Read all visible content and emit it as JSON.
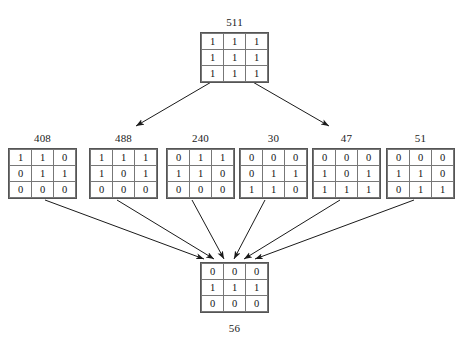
{
  "diagram": {
    "title_text": "",
    "type": "tree-of-binary-3x3-grids",
    "stroke_color": "#1a1a1a",
    "grid_border_color": "#777777",
    "background_color": "#ffffff"
  },
  "root": {
    "label": "511",
    "cells": [
      [
        "1",
        "1",
        "1"
      ],
      [
        "1",
        "1",
        "1"
      ],
      [
        "1",
        "1",
        "1"
      ]
    ],
    "x": 200,
    "y": 32
  },
  "middle": [
    {
      "label": "408",
      "cells": [
        [
          "1",
          "1",
          "0"
        ],
        [
          "0",
          "1",
          "1"
        ],
        [
          "0",
          "0",
          "0"
        ]
      ],
      "x": 8,
      "y": 148
    },
    {
      "label": "488",
      "cells": [
        [
          "1",
          "1",
          "1"
        ],
        [
          "1",
          "0",
          "1"
        ],
        [
          "0",
          "0",
          "0"
        ]
      ],
      "x": 89,
      "y": 148
    },
    {
      "label": "240",
      "cells": [
        [
          "0",
          "1",
          "1"
        ],
        [
          "1",
          "1",
          "0"
        ],
        [
          "0",
          "0",
          "0"
        ]
      ],
      "x": 166,
      "y": 148
    },
    {
      "label": "30",
      "cells": [
        [
          "0",
          "0",
          "0"
        ],
        [
          "0",
          "1",
          "1"
        ],
        [
          "1",
          "1",
          "0"
        ]
      ],
      "x": 239,
      "y": 148
    },
    {
      "label": "47",
      "cells": [
        [
          "0",
          "0",
          "0"
        ],
        [
          "1",
          "0",
          "1"
        ],
        [
          "1",
          "1",
          "1"
        ]
      ],
      "x": 312,
      "y": 148
    },
    {
      "label": "51",
      "cells": [
        [
          "0",
          "0",
          "0"
        ],
        [
          "1",
          "1",
          "0"
        ],
        [
          "0",
          "1",
          "1"
        ]
      ],
      "x": 386,
      "y": 148
    }
  ],
  "bottom": {
    "label": "56",
    "cells": [
      [
        "0",
        "0",
        "0"
      ],
      [
        "1",
        "1",
        "1"
      ],
      [
        "0",
        "0",
        "0"
      ]
    ],
    "x": 200,
    "y": 262
  },
  "arrows": {
    "from_root": [
      {
        "x1": 213,
        "y1": 81,
        "x2": 136,
        "y2": 126
      },
      {
        "x1": 251,
        "y1": 81,
        "x2": 329,
        "y2": 126
      }
    ],
    "to_bottom": [
      {
        "x1": 45,
        "y1": 200,
        "x2": 204,
        "y2": 259
      },
      {
        "x1": 117,
        "y1": 200,
        "x2": 214,
        "y2": 259
      },
      {
        "x1": 192,
        "y1": 200,
        "x2": 224,
        "y2": 259
      },
      {
        "x1": 265,
        "y1": 200,
        "x2": 234,
        "y2": 259
      },
      {
        "x1": 340,
        "y1": 200,
        "x2": 244,
        "y2": 259
      },
      {
        "x1": 414,
        "y1": 200,
        "x2": 255,
        "y2": 259
      }
    ]
  },
  "chart_data": {
    "type": "diagram",
    "nodes": [
      {
        "id": "511",
        "level": 0,
        "value": 511,
        "grid": [
          [
            1,
            1,
            1
          ],
          [
            1,
            1,
            1
          ],
          [
            1,
            1,
            1
          ]
        ]
      },
      {
        "id": "408",
        "level": 1,
        "value": 408,
        "grid": [
          [
            1,
            1,
            0
          ],
          [
            0,
            1,
            1
          ],
          [
            0,
            0,
            0
          ]
        ]
      },
      {
        "id": "488",
        "level": 1,
        "value": 488,
        "grid": [
          [
            1,
            1,
            1
          ],
          [
            1,
            0,
            1
          ],
          [
            0,
            0,
            0
          ]
        ]
      },
      {
        "id": "240",
        "level": 1,
        "value": 240,
        "grid": [
          [
            0,
            1,
            1
          ],
          [
            1,
            1,
            0
          ],
          [
            0,
            0,
            0
          ]
        ]
      },
      {
        "id": "30",
        "level": 1,
        "value": 30,
        "grid": [
          [
            0,
            0,
            0
          ],
          [
            0,
            1,
            1
          ],
          [
            1,
            1,
            0
          ]
        ]
      },
      {
        "id": "47",
        "level": 1,
        "value": 47,
        "grid": [
          [
            0,
            0,
            0
          ],
          [
            1,
            0,
            1
          ],
          [
            1,
            1,
            1
          ]
        ]
      },
      {
        "id": "51",
        "level": 1,
        "value": 51,
        "grid": [
          [
            0,
            0,
            0
          ],
          [
            1,
            1,
            0
          ],
          [
            0,
            1,
            1
          ]
        ]
      },
      {
        "id": "56",
        "level": 2,
        "value": 56,
        "grid": [
          [
            0,
            0,
            0
          ],
          [
            1,
            1,
            1
          ],
          [
            0,
            0,
            0
          ]
        ]
      }
    ],
    "edges": [
      {
        "from": "511",
        "to": "408"
      },
      {
        "from": "511",
        "to": "51"
      },
      {
        "from": "408",
        "to": "56"
      },
      {
        "from": "488",
        "to": "56"
      },
      {
        "from": "240",
        "to": "56"
      },
      {
        "from": "30",
        "to": "56"
      },
      {
        "from": "47",
        "to": "56"
      },
      {
        "from": "51",
        "to": "56"
      }
    ]
  }
}
